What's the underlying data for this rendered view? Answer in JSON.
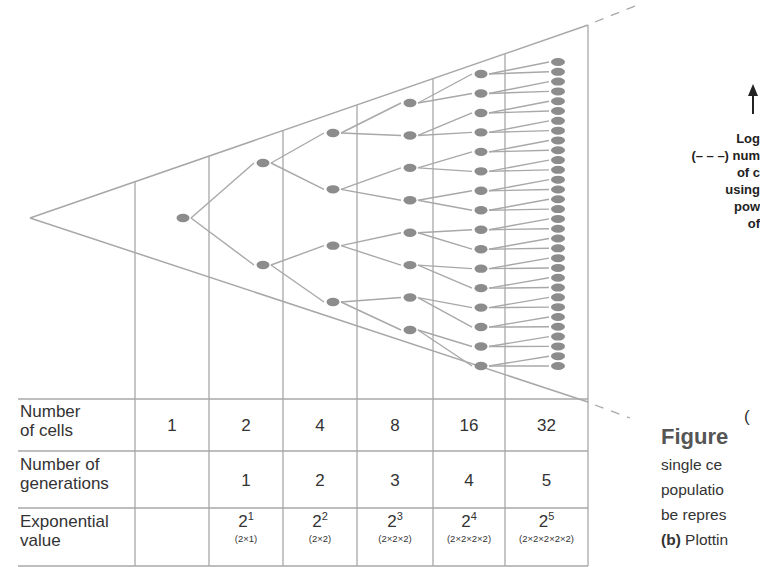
{
  "table": {
    "rows": [
      {
        "label_line1": "Number",
        "label_line2": "of cells",
        "values": [
          "1",
          "2",
          "4",
          "8",
          "16",
          "32"
        ]
      },
      {
        "label_line1": "Number of",
        "label_line2": "generations",
        "values": [
          "",
          "1",
          "2",
          "3",
          "4",
          "5"
        ]
      },
      {
        "label_line1": "Exponential",
        "label_line2": "value",
        "values": [
          {
            "base": "",
            "exp": "",
            "expansion": ""
          },
          {
            "base": "2",
            "exp": "1",
            "expansion": "(2×1)"
          },
          {
            "base": "2",
            "exp": "2",
            "expansion": "(2×2)"
          },
          {
            "base": "2",
            "exp": "3",
            "expansion": "(2×2×2)"
          },
          {
            "base": "2",
            "exp": "4",
            "expansion": "(2×2×2×2)"
          },
          {
            "base": "2",
            "exp": "5",
            "expansion": "(2×2×2×2×2)"
          }
        ]
      }
    ]
  },
  "tree": {
    "generations": [
      1,
      2,
      4,
      8,
      16,
      32
    ],
    "node_color": "#8c8c8c",
    "line_color": "#a8a8a8"
  },
  "side_label": {
    "line1": "Log",
    "line2": "(– – –) num",
    "line3": "of c",
    "line4": "using",
    "line5": "pow",
    "line6": "of"
  },
  "panel_letter": "(",
  "caption": {
    "title": "Figure",
    "line1": "single ce",
    "line2": "populatio",
    "line3": "be repres",
    "line4_bold": "(b)",
    "line4_rest": " Plottin"
  }
}
